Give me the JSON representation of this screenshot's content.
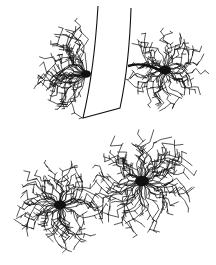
{
  "figure": {
    "background": "#ffffff",
    "ink": "#111111",
    "vessel": {
      "label": "blood-vessel",
      "outline": "M 98 6 C 96 40, 92 80, 83 118 L 120 108 C 126 80, 130 40, 131 8"
    },
    "cells": [
      {
        "name": "astrocyte-top-left",
        "cx": 86,
        "cy": 74,
        "radius": 52,
        "spread_start": 110,
        "spread_end": 260,
        "branches": 34,
        "soma": 5
      },
      {
        "name": "astrocyte-top-right",
        "cx": 165,
        "cy": 70,
        "radius": 40,
        "spread_start": -180,
        "spread_end": 180,
        "branches": 40,
        "soma": 6,
        "endfoot": "M 128 66 C 140 62, 150 66, 160 70"
      },
      {
        "name": "astrocyte-bottom-left",
        "cx": 60,
        "cy": 205,
        "radius": 46,
        "spread_start": -180,
        "spread_end": 180,
        "branches": 48,
        "soma": 6
      },
      {
        "name": "astrocyte-bottom-right",
        "cx": 142,
        "cy": 181,
        "radius": 52,
        "spread_start": -180,
        "spread_end": 180,
        "branches": 54,
        "soma": 7
      }
    ]
  }
}
